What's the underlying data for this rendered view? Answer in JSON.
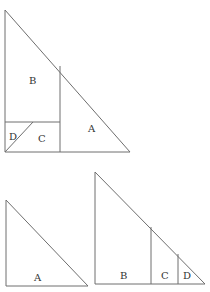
{
  "diagram": {
    "colors": {
      "stroke": "#6e6e6e",
      "label": "#333333",
      "background": "#ffffff"
    },
    "figures": [
      {
        "name": "large-triangle",
        "labels": [
          {
            "text": "B",
            "x": 29,
            "y": 84
          },
          {
            "text": "A",
            "x": 88,
            "y": 132
          },
          {
            "text": "D",
            "x": 9,
            "y": 140
          },
          {
            "text": "C",
            "x": 38,
            "y": 142
          }
        ]
      },
      {
        "name": "small-triangle-a",
        "labels": [
          {
            "text": "A",
            "x": 34,
            "y": 281
          }
        ]
      },
      {
        "name": "medium-triangle-bcd",
        "labels": [
          {
            "text": "B",
            "x": 120,
            "y": 279
          },
          {
            "text": "C",
            "x": 161,
            "y": 279
          },
          {
            "text": "D",
            "x": 183,
            "y": 279
          }
        ]
      }
    ]
  }
}
